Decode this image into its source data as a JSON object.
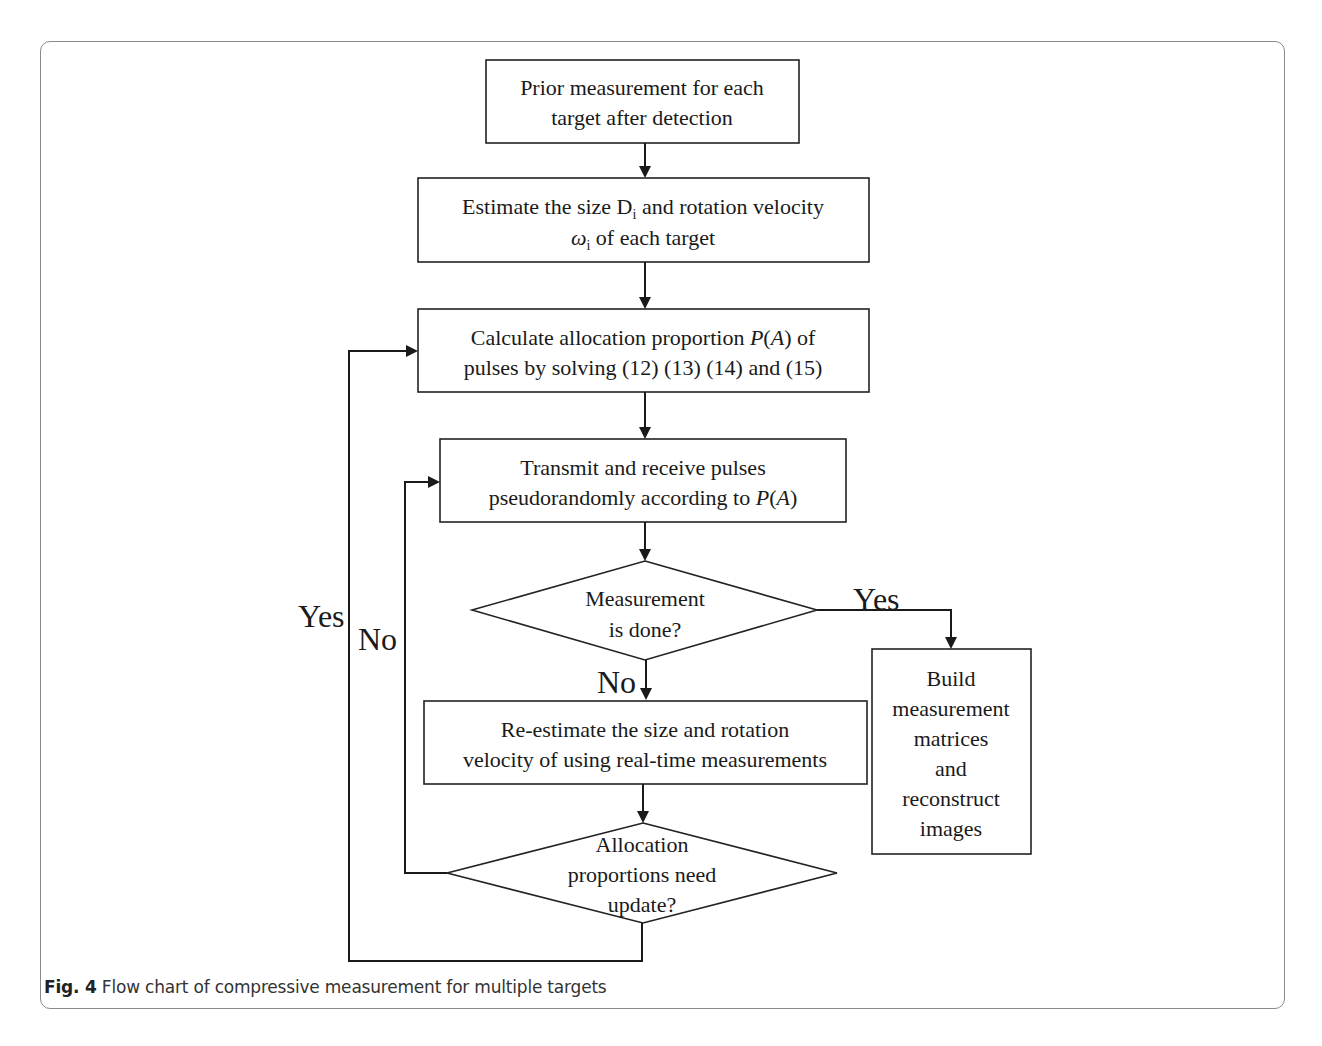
{
  "figure": {
    "caption_label": "Fig. 4",
    "caption_text": " Flow chart of compressive measurement for multiple targets"
  },
  "nodes": {
    "prior": {
      "line1": "Prior measurement for each",
      "line2": "target after detection"
    },
    "estimate": {
      "line1_pre": "Estimate the size D",
      "line1_sub": "i",
      "line1_post": " and rotation velocity",
      "line2_sym": "ω",
      "line2_sub": "i",
      "line2_post": " of each target"
    },
    "calculate": {
      "line1_pre": "Calculate allocation proportion ",
      "line1_math": "P",
      "line1_paren_open": "(",
      "line1_math2": "A",
      "line1_paren_close": ")",
      "line1_post": " of",
      "line2": "pulses by solving (12) (13) (14) and (15)"
    },
    "transmit": {
      "line1": "Transmit and receive pulses",
      "line2_pre": "pseudorandomly according to ",
      "line2_math": "P",
      "line2_paren_open": "(",
      "line2_math2": "A",
      "line2_paren_close": ")"
    },
    "measurement_done": {
      "line1": "Measurement",
      "line2": "is done?"
    },
    "reestimate": {
      "line1": "Re-estimate the size and rotation",
      "line2": "velocity of using real-time measurements"
    },
    "build": {
      "lines": [
        "Build",
        "measurement",
        "matrices",
        "and",
        "reconstruct",
        "images"
      ]
    },
    "allocation_update": {
      "line1": "Allocation",
      "line2": "proportions need",
      "line3": "update?"
    }
  },
  "edge_labels": {
    "done_yes": "Yes",
    "done_no": "No",
    "update_yes": "Yes",
    "update_no": "No"
  }
}
